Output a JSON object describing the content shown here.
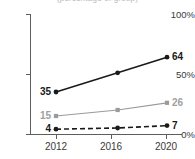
{
  "chart_data": {
    "type": "line",
    "title": "(percentage of group)",
    "xlabel": "",
    "ylabel": "",
    "x": [
      2012,
      2017,
      2021
    ],
    "categories": [
      "2012",
      "2017",
      "2021"
    ],
    "xlim": [
      2011,
      2022
    ],
    "ylim": [
      0,
      100
    ],
    "xticks": [
      2012,
      2016,
      2020
    ],
    "xtick_labels": [
      "2012",
      "2016",
      "2020"
    ],
    "yticks": [
      0,
      50,
      100
    ],
    "ytick_labels": [
      "0%",
      "50%",
      "100%"
    ],
    "grid": false,
    "legend": "none",
    "series": [
      {
        "name": "series-1",
        "color": "#1a1a1a",
        "style": "solid",
        "marker": "circle",
        "values": [
          35,
          51,
          64
        ],
        "labels": [
          "35",
          "",
          "64"
        ]
      },
      {
        "name": "series-2",
        "color": "#9a9a9a",
        "style": "solid",
        "marker": "square",
        "values": [
          15,
          20,
          26
        ],
        "labels": [
          "15",
          "",
          "26"
        ]
      },
      {
        "name": "series-3",
        "color": "#1a1a1a",
        "style": "dashed",
        "marker": "circle",
        "values": [
          4,
          5,
          7
        ],
        "labels": [
          "4",
          "",
          "7"
        ]
      }
    ]
  },
  "axis": {
    "y": {
      "t100": "100%",
      "t50": "50%",
      "t0": "0%"
    },
    "x": {
      "t2012": "2012",
      "t2016": "2016",
      "t2020": "2020"
    }
  },
  "point_labels": {
    "s1_start": "35",
    "s1_end": "64",
    "s2_start": "15",
    "s2_end": "26",
    "s3_start": "4",
    "s3_end": "7"
  },
  "colors": {
    "dark_series": "#1a1a1a",
    "gray_series": "#9a9a9a",
    "axis": "#5d5d5d",
    "background": "#ffffff"
  }
}
